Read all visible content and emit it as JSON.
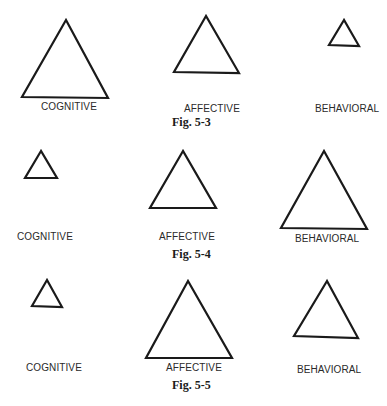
{
  "figures": [
    {
      "caption": "Fig. 5-3",
      "items": [
        {
          "label": "COGNITIVE",
          "size": "large"
        },
        {
          "label": "AFFECTIVE",
          "size": "medium"
        },
        {
          "label": "BEHAVIORAL",
          "size": "small"
        }
      ]
    },
    {
      "caption": "Fig. 5-4",
      "items": [
        {
          "label": "COGNITIVE",
          "size": "small"
        },
        {
          "label": "AFFECTIVE",
          "size": "medium"
        },
        {
          "label": "BEHAVIORAL",
          "size": "large"
        }
      ]
    },
    {
      "caption": "Fig. 5-5",
      "items": [
        {
          "label": "COGNITIVE",
          "size": "small"
        },
        {
          "label": "AFFECTIVE",
          "size": "large"
        },
        {
          "label": "BEHAVIORAL",
          "size": "medium"
        }
      ]
    }
  ],
  "colors": {
    "stroke": "#1a1a1a",
    "text": "#2a2a2a",
    "background": "#ffffff"
  }
}
